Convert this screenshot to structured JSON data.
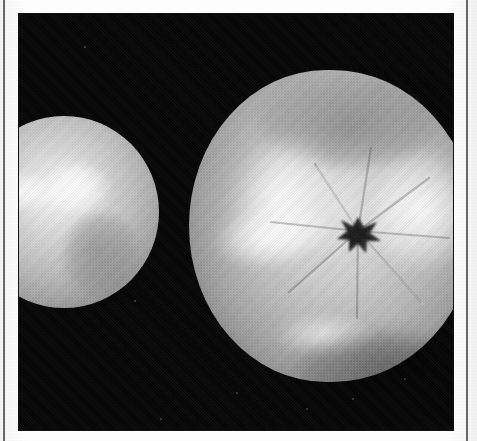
{
  "page": {
    "type": "scanned-book-page",
    "background_color": "#fdfdfd",
    "width": 477,
    "height": 441
  },
  "rules": {
    "left": {
      "name": "left-page-rule",
      "color": "#2d2d2d",
      "x": 3,
      "width": 2
    },
    "right": {
      "name": "right-page-rule",
      "color": "#2d2d2d",
      "x": 466,
      "width": 2
    }
  },
  "photo": {
    "name": "fruit-photograph",
    "subject": "two fruits on a black background",
    "tone": "black-and-white halftone",
    "background_color": "#050505",
    "frame": {
      "x": 19,
      "y": 14,
      "width": 434,
      "height": 416
    }
  },
  "subjects": [
    {
      "id": "fruit-left",
      "label": "left fruit",
      "description": "pale round fruit, cropped by the left edge of the photograph",
      "highlight_color": "#ffffff",
      "body_color": "#c3c3c3"
    },
    {
      "id": "fruit-right",
      "label": "right fruit",
      "description": "large round fruit with a dark star-shaped calyx scar and radiating grooves",
      "highlight_color": "#ffffff",
      "body_color": "#bcbcbc",
      "calyx_color": "#2a2a2a"
    }
  ],
  "specks": [
    {
      "x": 236,
      "y": 392,
      "size": 2
    },
    {
      "x": 306,
      "y": 408,
      "size": 2
    },
    {
      "x": 352,
      "y": 398,
      "size": 2
    },
    {
      "x": 404,
      "y": 378,
      "size": 2
    },
    {
      "x": 160,
      "y": 418,
      "size": 2
    },
    {
      "x": 134,
      "y": 300,
      "size": 2
    },
    {
      "x": 84,
      "y": 46,
      "size": 2
    }
  ],
  "caption": ""
}
